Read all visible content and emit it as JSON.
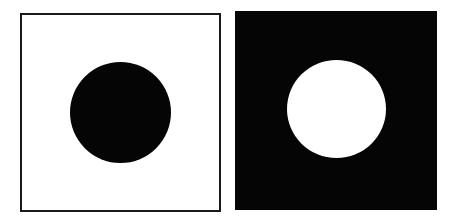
{
  "figure": {
    "panels": [
      {
        "name": "left",
        "background": "#ffffff",
        "border": "#1a1a1a",
        "disc_color": "#050505",
        "label": "black disc on white"
      },
      {
        "name": "right",
        "background": "#050505",
        "border": null,
        "disc_color": "#ffffff",
        "label": "white disc on black"
      }
    ]
  }
}
